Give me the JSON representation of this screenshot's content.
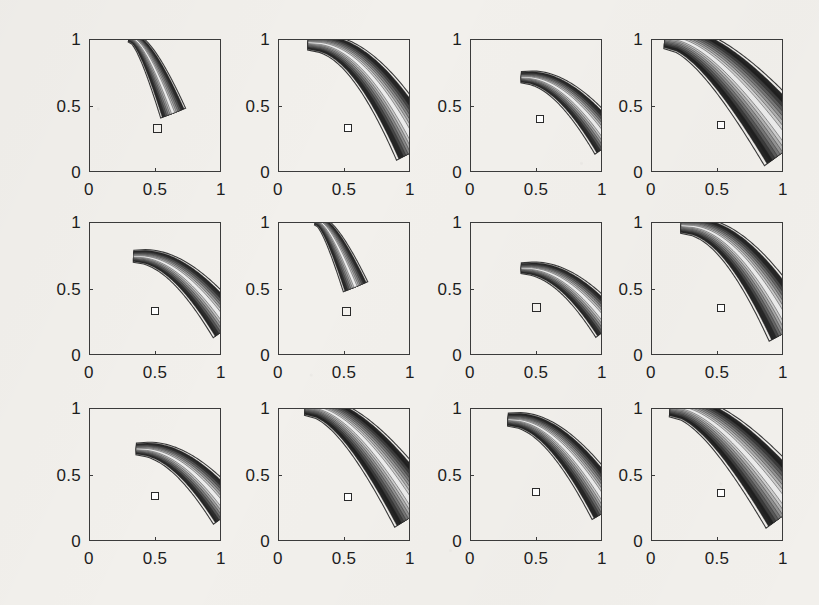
{
  "figure": {
    "kind": "contour-plot-grid",
    "rows": 3,
    "cols": 4,
    "background_color": "#f2f0ec",
    "axis_color": "#3b3b3b",
    "contour_fill_dark": "#1e1e1e",
    "contour_fill_light": "#d6d4d0",
    "marker_fill": "#ffffff",
    "marker_edge": "#2a2a2a"
  },
  "axes": {
    "x_ticks": [
      "0",
      "0.5",
      "1"
    ],
    "y_ticks": [
      "0",
      "0.5",
      "1"
    ],
    "xlim": [
      0,
      1
    ],
    "ylim": [
      0,
      1
    ],
    "xlabel": "",
    "ylabel": ""
  },
  "chart_data": {
    "type": "contour",
    "title": "",
    "xlabel": "",
    "ylabel": "",
    "xlim": [
      0,
      1
    ],
    "ylim": [
      0,
      1
    ],
    "x_ticks": [
      0,
      0.5,
      1
    ],
    "y_ticks": [
      0,
      0.5,
      1
    ],
    "x_tick_labels": [
      "0",
      "0.5",
      "1"
    ],
    "y_tick_labels": [
      "0",
      "0.5",
      "1"
    ],
    "grid": false,
    "legend": null,
    "subplot_layout": {
      "rows": 3,
      "cols": 4
    },
    "panels": [
      {
        "index": 1,
        "row": 1,
        "col": 1,
        "marker": {
          "x": 0.52,
          "y": 0.33,
          "style": "hollow-square"
        },
        "valley": {
          "ridge_start": [
            0.3,
            1.02
          ],
          "ridge_end": [
            0.63,
            0.45
          ],
          "width": 0.085,
          "taper": 0.92,
          "curvature": "steep-narrow"
        },
        "n_levels": 8,
        "description": "narrow steep valley descending from top-left toward center, minimum above marker"
      },
      {
        "index": 2,
        "row": 1,
        "col": 2,
        "marker": {
          "x": 0.53,
          "y": 0.33,
          "style": "filled-square"
        },
        "valley": {
          "ridge_start": [
            0.22,
            0.98
          ],
          "ridge_end": [
            1.05,
            0.18
          ],
          "width": 0.13,
          "taper": 0.55,
          "curvature": "hyperbolic-wide"
        },
        "n_levels": 9,
        "description": "broad hyperbolic banana valley spanning full panel, marker inside dark core"
      },
      {
        "index": 3,
        "row": 1,
        "col": 3,
        "marker": {
          "x": 0.53,
          "y": 0.4,
          "style": "filled-square"
        },
        "valley": {
          "ridge_start": [
            0.38,
            0.72
          ],
          "ridge_end": [
            1.05,
            0.22
          ],
          "width": 0.1,
          "taper": 0.6,
          "curvature": "moderate"
        },
        "n_levels": 8,
        "description": "medium banana valley opening to lower right, marker near narrow end"
      },
      {
        "index": 4,
        "row": 1,
        "col": 4,
        "marker": {
          "x": 0.53,
          "y": 0.35,
          "style": "filled-square"
        },
        "valley": {
          "ridge_start": [
            0.1,
            1.02
          ],
          "ridge_end": [
            1.05,
            0.2
          ],
          "width": 0.2,
          "taper": 0.85,
          "curvature": "very-wide-hyperbolic"
        },
        "n_levels": 10,
        "description": "very wide dark hyperbolic band filling upper-left to lower-right"
      },
      {
        "index": 5,
        "row": 2,
        "col": 1,
        "marker": {
          "x": 0.5,
          "y": 0.33,
          "style": "filled-square"
        },
        "valley": {
          "ridge_start": [
            0.33,
            0.75
          ],
          "ridge_end": [
            1.05,
            0.22
          ],
          "width": 0.105,
          "taper": 0.6,
          "curvature": "moderate"
        },
        "n_levels": 8,
        "description": "banana valley from upper-left center to right edge, marker at the narrow end"
      },
      {
        "index": 6,
        "row": 2,
        "col": 2,
        "marker": {
          "x": 0.52,
          "y": 0.33,
          "style": "hollow-square"
        },
        "valley": {
          "ridge_start": [
            0.28,
            1.02
          ],
          "ridge_end": [
            0.58,
            0.52
          ],
          "width": 0.085,
          "taper": 0.95,
          "curvature": "steep-narrow"
        },
        "n_levels": 8,
        "description": "narrow steep valley from top edge ending above the marker"
      },
      {
        "index": 7,
        "row": 2,
        "col": 3,
        "marker": {
          "x": 0.5,
          "y": 0.36,
          "style": "hollow-square"
        },
        "valley": {
          "ridge_start": [
            0.38,
            0.66
          ],
          "ridge_end": [
            1.05,
            0.22
          ],
          "width": 0.095,
          "taper": 0.55,
          "curvature": "shallow"
        },
        "n_levels": 8,
        "description": "shallow elongated valley to the right, hollow marker at left tip"
      },
      {
        "index": 8,
        "row": 2,
        "col": 4,
        "marker": {
          "x": 0.53,
          "y": 0.35,
          "style": "filled-square"
        },
        "valley": {
          "ridge_start": [
            0.22,
            0.98
          ],
          "ridge_end": [
            1.05,
            0.2
          ],
          "width": 0.135,
          "taper": 0.58,
          "curvature": "hyperbolic-wide"
        },
        "n_levels": 9,
        "description": "wide hyperbolic banana valley, marker inside dark core"
      },
      {
        "index": 9,
        "row": 3,
        "col": 1,
        "marker": {
          "x": 0.5,
          "y": 0.34,
          "style": "filled-square"
        },
        "valley": {
          "ridge_start": [
            0.35,
            0.7
          ],
          "ridge_end": [
            1.05,
            0.22
          ],
          "width": 0.105,
          "taper": 0.58,
          "curvature": "moderate"
        },
        "n_levels": 8,
        "description": "banana valley to lower right, marker inside light core"
      },
      {
        "index": 10,
        "row": 3,
        "col": 2,
        "marker": {
          "x": 0.53,
          "y": 0.33,
          "style": "filled-square"
        },
        "valley": {
          "ridge_start": [
            0.2,
            1.02
          ],
          "ridge_end": [
            1.05,
            0.22
          ],
          "width": 0.16,
          "taper": 0.75,
          "curvature": "wide-hyperbolic"
        },
        "n_levels": 10,
        "description": "wide dark hyperbolic band from top-left to right edge"
      },
      {
        "index": 11,
        "row": 3,
        "col": 3,
        "marker": {
          "x": 0.5,
          "y": 0.37,
          "style": "filled-square"
        },
        "valley": {
          "ridge_start": [
            0.28,
            0.92
          ],
          "ridge_end": [
            1.05,
            0.25
          ],
          "width": 0.115,
          "taper": 0.62,
          "curvature": "moderate-wide"
        },
        "n_levels": 9,
        "description": "banana valley from upper-left to right edge, marker mid-valley"
      },
      {
        "index": 12,
        "row": 3,
        "col": 4,
        "marker": {
          "x": 0.53,
          "y": 0.36,
          "style": "filled-square"
        },
        "valley": {
          "ridge_start": [
            0.14,
            1.02
          ],
          "ridge_end": [
            1.05,
            0.24
          ],
          "width": 0.185,
          "taper": 0.82,
          "curvature": "very-wide-hyperbolic"
        },
        "n_levels": 10,
        "description": "very wide dark hyperbolic band filling most of the panel"
      }
    ]
  }
}
